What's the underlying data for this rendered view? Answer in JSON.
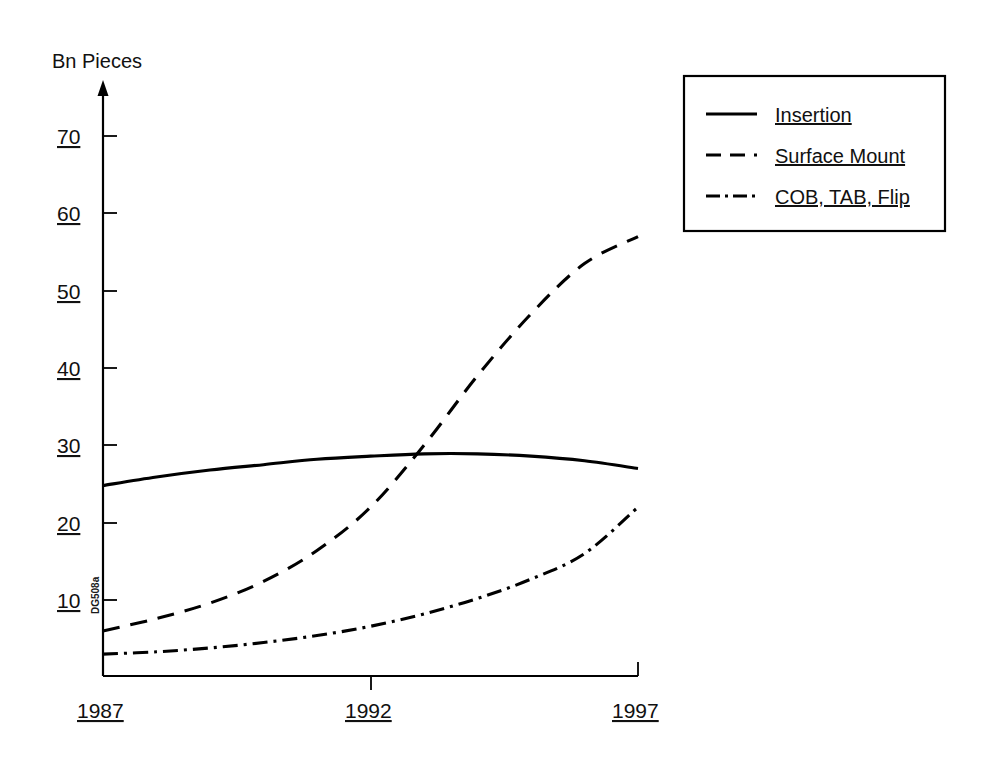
{
  "chart_data": {
    "type": "line",
    "title": "",
    "xlabel": "",
    "ylabel": "Bn Pieces",
    "xlim": [
      1987,
      1997
    ],
    "ylim": [
      0,
      75
    ],
    "grid": false,
    "legend_position": "top-right",
    "x_ticks": [
      "1987",
      "1992",
      "1997"
    ],
    "x_tick_values": [
      1987,
      1992,
      1997
    ],
    "y_ticks": [
      "10",
      "20",
      "30",
      "40",
      "50",
      "60",
      "70"
    ],
    "y_tick_values": [
      10,
      20,
      30,
      40,
      50,
      60,
      70
    ],
    "x": [
      1987,
      1988,
      1989,
      1990,
      1991,
      1992,
      1993,
      1994,
      1995,
      1996,
      1997
    ],
    "series": [
      {
        "name": "Insertion",
        "style": "solid",
        "values": [
          24.8,
          25.9,
          26.8,
          27.5,
          28.2,
          28.6,
          28.9,
          28.9,
          28.6,
          28.0,
          27.0
        ]
      },
      {
        "name": "Surface Mount",
        "style": "dashed",
        "values": [
          6.0,
          7.6,
          9.6,
          12.4,
          16.4,
          22.0,
          30.0,
          39.0,
          47.0,
          53.5,
          57.0
        ]
      },
      {
        "name": "COB, TAB, Flip",
        "style": "dash-dot",
        "values": [
          3.0,
          3.3,
          3.8,
          4.5,
          5.4,
          6.6,
          8.2,
          10.2,
          12.7,
          16.0,
          22.0
        ]
      }
    ],
    "annotations": [
      {
        "name": "source-code",
        "text": "DG508a"
      }
    ],
    "colors": {
      "line": "#000000",
      "axis": "#000000",
      "background": "#ffffff"
    }
  },
  "legend": {
    "items": [
      {
        "label": "Insertion",
        "style": "solid"
      },
      {
        "label": "Surface Mount",
        "style": "dashed"
      },
      {
        "label": "COB, TAB, Flip",
        "style": "dash-dot"
      }
    ]
  },
  "axis": {
    "y_title": "Bn Pieces"
  },
  "watermark": {
    "text": "DG508a"
  }
}
